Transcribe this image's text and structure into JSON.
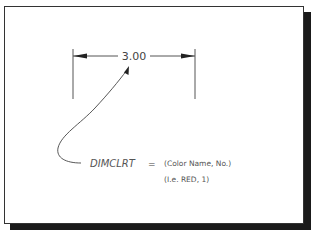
{
  "diagram": {
    "dimension": {
      "value_text": "3.00",
      "left_extension_x": 73,
      "right_extension_x": 195,
      "dimension_line_y": 56
    },
    "variable": {
      "name": "DIMCLRT",
      "equals": "=",
      "value_line1": "(Color Name, No.)",
      "value_line2": "(I.e. RED, 1)"
    },
    "colors": {
      "line": "#555555",
      "frame_border": "#333333",
      "shadow": "#1a1a1a",
      "background": "#ffffff"
    }
  }
}
